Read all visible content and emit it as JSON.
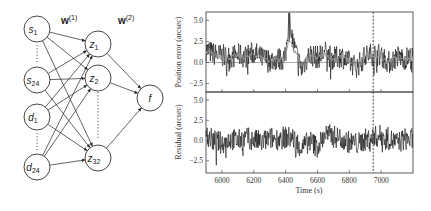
{
  "network": {
    "weight_labels": [
      {
        "base": "w",
        "sup": "(1)"
      },
      {
        "base": "w",
        "sup": "(2)"
      }
    ],
    "input_nodes": [
      {
        "base": "s",
        "sub": "1"
      },
      {
        "base": "s",
        "sub": "24"
      },
      {
        "base": "d",
        "sub": "1"
      },
      {
        "base": "d",
        "sub": "24"
      }
    ],
    "hidden_nodes": [
      {
        "base": "z",
        "sub": "1"
      },
      {
        "base": "z",
        "sub": "2"
      },
      {
        "base": "z",
        "sub": "32"
      }
    ],
    "output_node": {
      "base": "f"
    }
  },
  "chart_data": [
    {
      "type": "line",
      "title": "",
      "xlabel": "",
      "ylabel": "Position error (arcsec)",
      "xlim": [
        5900,
        7200
      ],
      "ylim": [
        -3.5,
        6
      ],
      "yticks": [
        -2.5,
        0.0,
        2.5,
        5.0
      ],
      "ytick_labels": [
        "−2.5",
        "0.0",
        "2.5",
        "5.0"
      ],
      "xticks": [
        6000,
        6200,
        6400,
        6600,
        6800,
        7000
      ],
      "hline": 0.0,
      "vline_dashed": 6950,
      "series": [
        {
          "name": "measured position error (black, noisy)",
          "color": "#111111",
          "x": [
            5900,
            5950,
            6000,
            6050,
            6100,
            6150,
            6200,
            6250,
            6300,
            6350,
            6400,
            6420,
            6450,
            6500,
            6550,
            6600,
            6650,
            6700,
            6750,
            6800,
            6850,
            6900,
            6950,
            7000,
            7050,
            7100,
            7150,
            7200
          ],
          "y": [
            1.5,
            1.0,
            0.8,
            0.6,
            0.9,
            0.7,
            1.2,
            0.5,
            0.3,
            0.4,
            0.5,
            5.5,
            2.0,
            -0.8,
            1.0,
            0.6,
            1.2,
            0.4,
            0.8,
            0.0,
            -0.5,
            0.8,
            1.0,
            0.9,
            0.0,
            0.7,
            0.5,
            0.6
          ]
        },
        {
          "name": "model prediction (gray, smooth)",
          "color": "#999999",
          "x": [
            5900,
            5950,
            6000,
            6050,
            6100,
            6150,
            6200,
            6250,
            6300,
            6350,
            6400,
            6420,
            6450,
            6500,
            6550,
            6600,
            6650,
            6700,
            6750,
            6800,
            6850,
            6900,
            6950,
            7000,
            7050,
            7100,
            7150,
            7200
          ],
          "y": [
            1.2,
            0.9,
            0.7,
            0.6,
            0.8,
            0.6,
            1.0,
            0.5,
            0.3,
            0.4,
            0.4,
            3.0,
            1.5,
            -0.3,
            0.8,
            0.5,
            1.0,
            0.4,
            0.7,
            0.1,
            -0.2,
            0.7,
            0.9,
            0.8,
            0.1,
            0.6,
            0.5,
            0.5
          ]
        }
      ]
    },
    {
      "type": "line",
      "title": "",
      "xlabel": "Time (s)",
      "ylabel": "Residual (arcsec)",
      "xlim": [
        5900,
        7200
      ],
      "ylim": [
        -4,
        6
      ],
      "yticks": [
        -2.5,
        0.0,
        2.5,
        5.0
      ],
      "ytick_labels": [
        "−2.5",
        "0.0",
        "2.5",
        "5.0"
      ],
      "xticks": [
        6000,
        6200,
        6400,
        6600,
        6800,
        7000
      ],
      "xtick_labels": [
        "6000",
        "6200",
        "6400",
        "6600",
        "6800",
        "7000"
      ],
      "vline_dashed": 6950,
      "series": [
        {
          "name": "residual",
          "color": "#111111",
          "x": [
            5900,
            5950,
            6000,
            6050,
            6100,
            6150,
            6200,
            6250,
            6300,
            6350,
            6400,
            6450,
            6500,
            6550,
            6600,
            6650,
            6700,
            6750,
            6800,
            6850,
            6900,
            6950,
            7000,
            7050,
            7100,
            7150,
            7200
          ],
          "y": [
            0.5,
            0.0,
            -0.3,
            0.2,
            0.0,
            0.3,
            0.1,
            -0.2,
            0.3,
            0.2,
            0.4,
            0.3,
            -1.0,
            0.0,
            -0.8,
            0.8,
            0.5,
            0.3,
            -0.2,
            -0.4,
            0.1,
            0.4,
            0.6,
            0.2,
            -0.3,
            0.2,
            0.1
          ]
        }
      ]
    }
  ]
}
